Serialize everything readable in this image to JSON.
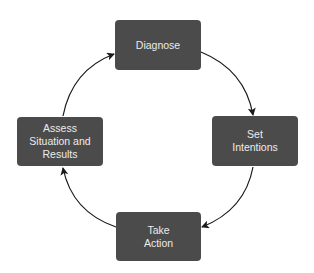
{
  "diagram": {
    "type": "cycle",
    "nodes": [
      {
        "id": "diagnose",
        "label": "Diagnose"
      },
      {
        "id": "set-intentions",
        "label": "Set\nIntentions"
      },
      {
        "id": "take-action",
        "label": "Take\nAction"
      },
      {
        "id": "assess",
        "label": "Assess\nSituation and\nResults"
      }
    ],
    "edges": [
      {
        "from": "diagnose",
        "to": "set-intentions"
      },
      {
        "from": "set-intentions",
        "to": "take-action"
      },
      {
        "from": "take-action",
        "to": "assess"
      },
      {
        "from": "assess",
        "to": "diagnose"
      }
    ],
    "colors": {
      "node_fill": "#4b4b4b",
      "node_text": "#ececec",
      "arrow": "#1a1a1a",
      "background": "#ffffff"
    }
  }
}
